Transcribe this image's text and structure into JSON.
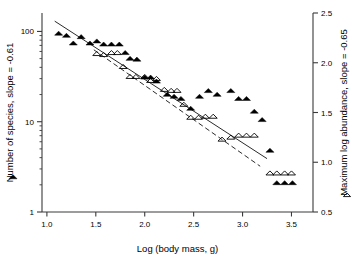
{
  "chart_data": {
    "type": "scatter",
    "title": "",
    "xlabel": "Log (body mass, g)",
    "ylabel_left": "Number of species, slope = -0.61",
    "ylabel_right": "Maximum log abundance, slope = -0.65",
    "xlim": [
      0.95,
      3.72
    ],
    "xticks": [
      1.0,
      1.5,
      2.0,
      2.5,
      3.0,
      3.5
    ],
    "xtick_labels": [
      "1.0",
      "1.5",
      "2.0",
      "2.5",
      "3.0",
      "3.5"
    ],
    "left_axis": {
      "scale": "log",
      "ylim": [
        1,
        160
      ],
      "ticks": [
        1,
        10,
        100
      ],
      "tick_labels": [
        "1",
        "10",
        "100"
      ],
      "minor_ticks": [
        2,
        3,
        4,
        5,
        6,
        7,
        8,
        9,
        20,
        30,
        40,
        50,
        60,
        70,
        80,
        90,
        200,
        300
      ]
    },
    "right_axis": {
      "scale": "linear",
      "ylim": [
        0.5,
        2.5
      ],
      "ticks": [
        0.5,
        1.0,
        1.5,
        2.0,
        2.5
      ],
      "tick_labels": [
        "0.5",
        "1.0",
        "1.5",
        "2.0",
        "2.5"
      ]
    },
    "grid": false,
    "legend_position": "outside-left-and-right",
    "series": [
      {
        "name": "Number of species",
        "marker": "filled-triangle",
        "axis": "left",
        "color": "#000000",
        "slope": -0.61,
        "points": [
          [
            1.12,
            95
          ],
          [
            1.2,
            90
          ],
          [
            1.27,
            74
          ],
          [
            1.35,
            87
          ],
          [
            1.44,
            74
          ],
          [
            1.51,
            78
          ],
          [
            1.58,
            72
          ],
          [
            1.66,
            72
          ],
          [
            1.74,
            72
          ],
          [
            1.8,
            58
          ],
          [
            1.85,
            50
          ],
          [
            1.92,
            49
          ],
          [
            2.0,
            31
          ],
          [
            2.06,
            31
          ],
          [
            2.12,
            28
          ],
          [
            2.23,
            20
          ],
          [
            2.3,
            19
          ],
          [
            2.37,
            18
          ],
          [
            2.47,
            14
          ],
          [
            2.56,
            19
          ],
          [
            2.65,
            22
          ],
          [
            2.74,
            20
          ],
          [
            2.88,
            22
          ],
          [
            2.96,
            18
          ],
          [
            3.04,
            18
          ],
          [
            3.12,
            13
          ],
          [
            3.2,
            10.5
          ],
          [
            3.28,
            4.8
          ],
          [
            3.35,
            2.1
          ],
          [
            3.43,
            2.1
          ],
          [
            3.51,
            2.1
          ]
        ]
      },
      {
        "name": "Maximum log abundance",
        "marker": "open-triangle",
        "axis": "right",
        "color": "#000000",
        "slope": -0.65,
        "points": [
          [
            1.51,
            2.09
          ],
          [
            1.58,
            2.08
          ],
          [
            1.66,
            2.1
          ],
          [
            1.72,
            2.1
          ],
          [
            1.78,
            1.96
          ],
          [
            1.85,
            1.86
          ],
          [
            1.91,
            1.86
          ],
          [
            2.0,
            1.86
          ],
          [
            2.06,
            1.82
          ],
          [
            2.12,
            1.84
          ],
          [
            2.2,
            1.73
          ],
          [
            2.27,
            1.72
          ],
          [
            2.33,
            1.72
          ],
          [
            2.4,
            1.58
          ],
          [
            2.47,
            1.45
          ],
          [
            2.55,
            1.45
          ],
          [
            2.62,
            1.46
          ],
          [
            2.7,
            1.46
          ],
          [
            2.79,
            1.23
          ],
          [
            2.88,
            1.25
          ],
          [
            2.96,
            1.27
          ],
          [
            3.04,
            1.27
          ],
          [
            3.12,
            1.27
          ],
          [
            3.28,
            0.89
          ],
          [
            3.35,
            0.89
          ],
          [
            3.43,
            0.89
          ],
          [
            3.5,
            0.89
          ]
        ]
      }
    ],
    "trend_lines": [
      {
        "name": "species-fit-line",
        "style": "solid",
        "axis": "left",
        "x0": 1.08,
        "y0": 130,
        "x1": 3.25,
        "y1": 3.9
      },
      {
        "name": "abundance-fit-line",
        "style": "dashed",
        "axis": "right",
        "x0": 1.48,
        "y0": 2.13,
        "x1": 3.18,
        "y1": 0.96
      }
    ],
    "legend": [
      {
        "marker": "filled-triangle",
        "series": "Number of species",
        "side": "left"
      },
      {
        "marker": "open-triangle",
        "series": "Maximum log abundance",
        "side": "right"
      }
    ]
  }
}
